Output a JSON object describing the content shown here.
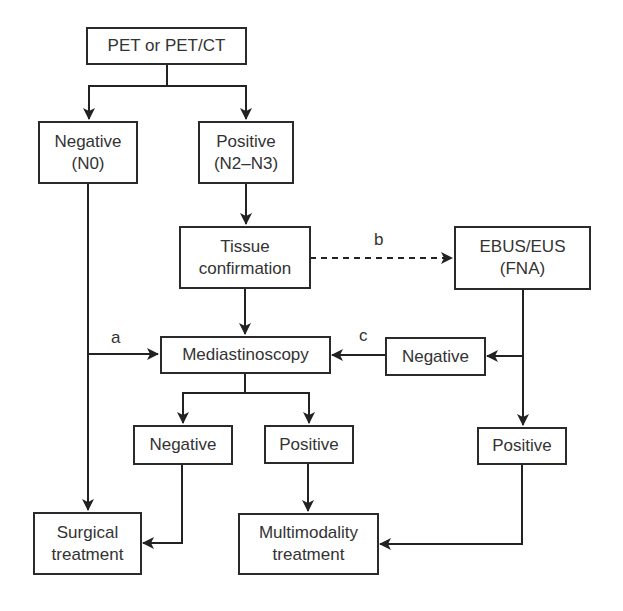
{
  "diagram": {
    "type": "flowchart",
    "nodes": {
      "pet": {
        "line1": "PET or PET/CT"
      },
      "neg_n0": {
        "line1": "Negative",
        "line2": "(N0)"
      },
      "pos_n2n3": {
        "line1": "Positive",
        "line2": "(N2–N3)"
      },
      "tissue": {
        "line1": "Tissue",
        "line2": "confirmation"
      },
      "ebus": {
        "line1": "EBUS/EUS",
        "line2": "(FNA)"
      },
      "mediastinoscopy": {
        "line1": "Mediastinoscopy"
      },
      "ebus_negative": {
        "line1": "Negative"
      },
      "med_negative": {
        "line1": "Negative"
      },
      "med_positive": {
        "line1": "Positive"
      },
      "ebus_positive": {
        "line1": "Positive"
      },
      "surgical": {
        "line1": "Surgical",
        "line2": "treatment"
      },
      "multimodality": {
        "line1": "Multimodality",
        "line2": "treatment"
      }
    },
    "edge_labels": {
      "a": "a",
      "b": "b",
      "c": "c"
    },
    "edges": [
      {
        "from": "pet",
        "to": "neg_n0"
      },
      {
        "from": "pet",
        "to": "pos_n2n3"
      },
      {
        "from": "pos_n2n3",
        "to": "tissue"
      },
      {
        "from": "tissue",
        "to": "ebus",
        "style": "dashed",
        "label": "b"
      },
      {
        "from": "tissue",
        "to": "mediastinoscopy"
      },
      {
        "from": "neg_n0",
        "to": "mediastinoscopy",
        "label": "a"
      },
      {
        "from": "neg_n0",
        "to": "surgical"
      },
      {
        "from": "ebus",
        "to": "ebus_negative"
      },
      {
        "from": "ebus",
        "to": "ebus_positive"
      },
      {
        "from": "ebus_negative",
        "to": "mediastinoscopy",
        "label": "c"
      },
      {
        "from": "mediastinoscopy",
        "to": "med_negative"
      },
      {
        "from": "mediastinoscopy",
        "to": "med_positive"
      },
      {
        "from": "med_negative",
        "to": "surgical"
      },
      {
        "from": "med_positive",
        "to": "multimodality"
      },
      {
        "from": "ebus_positive",
        "to": "multimodality"
      }
    ]
  }
}
